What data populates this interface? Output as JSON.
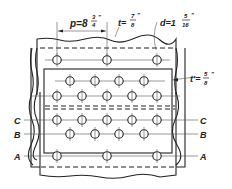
{
  "diagram": {
    "annotations": {
      "pitch": {
        "symbol": "p",
        "eq": "=",
        "whole": "8",
        "num": "3",
        "den": "4",
        "unit": "\""
      },
      "plate_thickness": {
        "symbol": "t",
        "eq": "=",
        "num": "7",
        "den": "8",
        "unit": "\""
      },
      "rivet_diameter": {
        "symbol": "d",
        "eq": "=",
        "whole": "1",
        "num": "5",
        "den": "16",
        "unit": "\""
      },
      "strap_thickness": {
        "symbol": "t'",
        "eq": "=",
        "num": "5",
        "den": "8",
        "unit": "\""
      }
    },
    "section_lines": [
      {
        "id": "C",
        "label": "C"
      },
      {
        "id": "B",
        "label": "B"
      },
      {
        "id": "A",
        "label": "A"
      }
    ],
    "rivet_rows": [
      {
        "row": "top-outer",
        "count": 3
      },
      {
        "row": "top-inner-1",
        "count": 4
      },
      {
        "row": "top-inner-2",
        "count": 5
      },
      {
        "row": "C",
        "count": 5
      },
      {
        "row": "B",
        "count": 4
      },
      {
        "row": "A",
        "count": 3
      }
    ]
  }
}
